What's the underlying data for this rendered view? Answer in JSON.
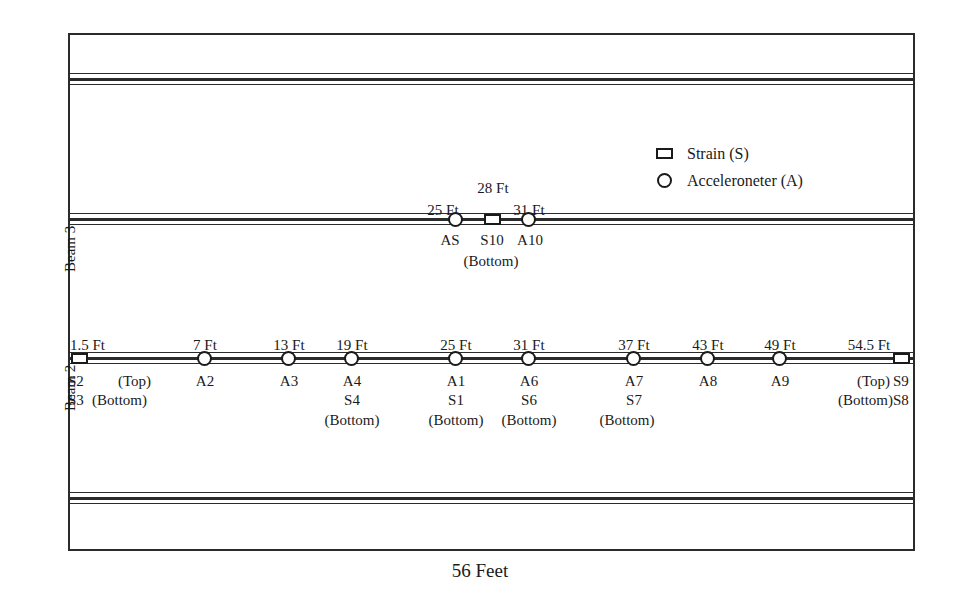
{
  "figure": {
    "span_caption": "56 Feet",
    "beam_names": {
      "beam3": "Beam 3",
      "beam2": "Beam 2"
    }
  },
  "legend": {
    "items": [
      {
        "marker": "square-icon",
        "label": "Strain (S)"
      },
      {
        "marker": "circle-icon",
        "label": "Acceleroneter (A)"
      }
    ]
  },
  "beam3": {
    "sensors": [
      {
        "distance": "25 Ft",
        "marker": "circle",
        "codes": [
          "AS"
        ]
      },
      {
        "distance": "28 Ft",
        "marker": "square",
        "codes": [
          "S10"
        ]
      },
      {
        "distance": "31 Ft",
        "marker": "circle",
        "codes": [
          "A10"
        ]
      }
    ],
    "position_note": "(Bottom)"
  },
  "beam2": {
    "sensors": [
      {
        "distance": "1.5 Ft",
        "marker": "square",
        "codes": [
          "S2",
          "S3"
        ],
        "notes": [
          "(Top)",
          "(Bottom)"
        ]
      },
      {
        "distance": "7 Ft",
        "marker": "circle",
        "codes": [
          "A2"
        ]
      },
      {
        "distance": "13 Ft",
        "marker": "circle",
        "codes": [
          "A3"
        ]
      },
      {
        "distance": "19 Ft",
        "marker": "circle",
        "codes": [
          "A4",
          "S4"
        ],
        "notes": [
          "(Bottom)"
        ]
      },
      {
        "distance": "25 Ft",
        "marker": "circle",
        "codes": [
          "A1",
          "S1"
        ],
        "notes": [
          "(Bottom)"
        ]
      },
      {
        "distance": "31 Ft",
        "marker": "circle",
        "codes": [
          "A6",
          "S6"
        ],
        "notes": [
          "(Bottom)"
        ]
      },
      {
        "distance": "37 Ft",
        "marker": "circle",
        "codes": [
          "A7",
          "S7"
        ],
        "notes": [
          "(Bottom)"
        ]
      },
      {
        "distance": "43 Ft",
        "marker": "circle",
        "codes": [
          "A8"
        ]
      },
      {
        "distance": "49 Ft",
        "marker": "circle",
        "codes": [
          "A9"
        ]
      },
      {
        "distance": "54.5 Ft",
        "marker": "square",
        "codes": [
          "S9",
          "S8"
        ],
        "notes": [
          "(Top)",
          "(Bottom)"
        ]
      }
    ]
  },
  "labels": {
    "b3_d1": "25 Ft",
    "b3_d2": "28 Ft",
    "b3_d3": "31 Ft",
    "b3_c1": "AS",
    "b3_c2": "S10",
    "b3_c3": "A10",
    "b3_bottom": "(Bottom)",
    "b2_d1": "1.5 Ft",
    "b2_d2": "7 Ft",
    "b2_d3": "13 Ft",
    "b2_d4": "19 Ft",
    "b2_d5": "25 Ft",
    "b2_d6": "31 Ft",
    "b2_d7": "37 Ft",
    "b2_d8": "43 Ft",
    "b2_d9": "49 Ft",
    "b2_d10": "54.5 Ft",
    "b2_c1_top": "S2",
    "b2_c1_top_note": "(Top)",
    "b2_c1_bot": "S3",
    "b2_c1_bot_note": "(Bottom)",
    "b2_c2": "A2",
    "b2_c3": "A3",
    "b2_c4a": "A4",
    "b2_c4b": "S4",
    "b2_c4n": "(Bottom)",
    "b2_c5a": "A1",
    "b2_c5b": "S1",
    "b2_c5n": "(Bottom)",
    "b2_c6a": "A6",
    "b2_c6b": "S6",
    "b2_c6n": "(Bottom)",
    "b2_c7a": "A7",
    "b2_c7b": "S7",
    "b2_c7n": "(Bottom)",
    "b2_c8": "A8",
    "b2_c9": "A9",
    "b2_c10_top_note": "(Top)",
    "b2_c10_top": "S9",
    "b2_c10_bot_note": "(Bottom)",
    "b2_c10_bot": "S8"
  },
  "colors": {
    "line": "#2b2b2b",
    "text": "#1a1a1a",
    "background": "#ffffff"
  }
}
